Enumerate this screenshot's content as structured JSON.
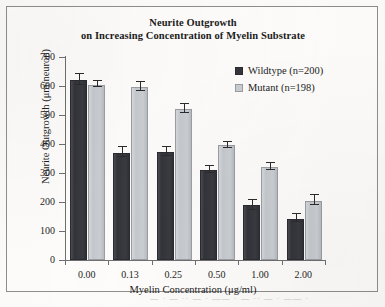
{
  "figure": {
    "title_line1": "Neurite Outgrowth",
    "title_line2": "on Increasing Concentration of Myelin Substrate",
    "frame_color": "#8e8e8e",
    "background_color": "#fefdfb"
  },
  "legend": {
    "position": "top-right",
    "entries": [
      {
        "label": "Wildtype (n=200)",
        "swatch": "dark-filled-square-icon",
        "color": "#34343b"
      },
      {
        "label": "Mutant (n=198)",
        "swatch": "light-filled-square-icon",
        "color": "#cbcfd3"
      }
    ]
  },
  "axes": {
    "y_title": "Neurite Outgrowth (μm/neuron)",
    "x_title": "Myelin Concentration (μg/ml)",
    "y_ticks": [
      "0",
      "100",
      "200",
      "300",
      "400",
      "500",
      "600",
      "700"
    ],
    "x_ticks": [
      "0.00",
      "0.13",
      "0.25",
      "0.50",
      "1.00",
      "2.00"
    ]
  },
  "artifact": {
    "smudge_text": "— · —  ·· — ·  ——  · — ··  — ·  —— ·"
  },
  "chart_data": {
    "type": "bar",
    "title": "Neurite Outgrowth on Increasing Concentration of Myelin Substrate",
    "xlabel": "Myelin Concentration (μg/ml)",
    "ylabel": "Neurite Outgrowth (μm/neuron)",
    "ylim": [
      0,
      700
    ],
    "ytick_step": 100,
    "grid": false,
    "legend_position": "top-right",
    "categories": [
      "0.00",
      "0.13",
      "0.25",
      "0.50",
      "1.00",
      "2.00"
    ],
    "series": [
      {
        "name": "Wildtype (n=200)",
        "color": "#34343b",
        "values": [
          620,
          370,
          373,
          310,
          188,
          143
        ],
        "errors": [
          20,
          18,
          18,
          13,
          20,
          15
        ]
      },
      {
        "name": "Mutant (n=198)",
        "color": "#cbcfd3",
        "values": [
          605,
          596,
          520,
          395,
          322,
          205
        ],
        "errors": [
          13,
          18,
          18,
          13,
          14,
          18
        ]
      }
    ]
  }
}
